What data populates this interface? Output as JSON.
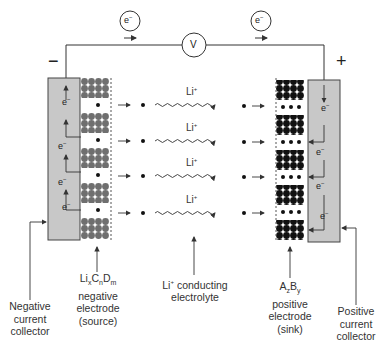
{
  "diagram": {
    "circuit": {
      "voltmeter_label": "V",
      "electron_left": "e−",
      "electron_right": "e−",
      "negative_terminal": "−",
      "positive_terminal": "+"
    },
    "ion_label": "Li+",
    "ion_rows": 4,
    "collector_electron_label": "e−",
    "labels": {
      "negative_collector": [
        "Negative",
        "current",
        "collector"
      ],
      "negative_electrode": [
        "LixCnDm",
        "negative",
        "electrode",
        "(source)"
      ],
      "electrolyte": [
        "Li+ conducting",
        "electrolyte"
      ],
      "positive_electrode": [
        "AzBy",
        "positive",
        "electrode",
        "(sink)"
      ],
      "positive_collector": [
        "Positive",
        "current",
        "collector"
      ]
    },
    "colors": {
      "collector_fill": "#c8c8c8",
      "negative_atom": "#7a7a7a",
      "positive_atom": "#111111",
      "line": "#333333"
    }
  }
}
